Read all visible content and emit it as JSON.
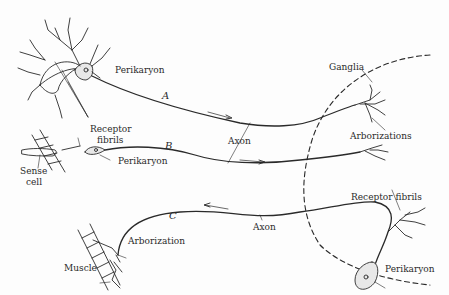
{
  "diagram": {
    "type": "neuron-pathway-illustration",
    "pathways": [
      {
        "id": "A",
        "label": "A",
        "direction": "toward ganglia"
      },
      {
        "id": "B",
        "label": "B",
        "direction": "toward ganglia"
      },
      {
        "id": "C",
        "label": "C",
        "direction": "away from ganglia"
      }
    ],
    "labels": {
      "perikaryon_a": "Perikaryon",
      "path_a": "A",
      "receptor_fibrils_left_1": "Receptor",
      "receptor_fibrils_left_2": "fibrils",
      "path_b": "B",
      "perikaryon_b": "Perikaryon",
      "sense_cell_1": "Sense",
      "sense_cell_2": "cell",
      "axon_ab": "Axon",
      "ganglia": "Ganglia",
      "arborizations": "Arborizations",
      "receptor_fibrils_right": "Receptor fibrils",
      "path_c": "C",
      "axon_c": "Axon",
      "arborization": "Arborization",
      "muscle": "Muscle",
      "perikaryon_c": "Perikaryon"
    },
    "colors": {
      "ink": "#2a2a2a",
      "background": "#fdfdfd"
    }
  }
}
